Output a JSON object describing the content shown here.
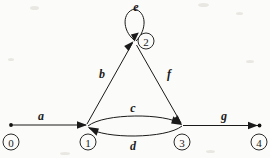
{
  "diagram": {
    "background_color": "#fbfbf9",
    "stroke_color": "#1a1a1a",
    "nodes": [
      {
        "id": "0",
        "label": "0",
        "cx": 11,
        "cy": 142,
        "r": 8,
        "kind": "start"
      },
      {
        "id": "1",
        "label": "1",
        "cx": 88,
        "cy": 142,
        "r": 8,
        "kind": "state"
      },
      {
        "id": "2",
        "label": "2",
        "cx": 146,
        "cy": 41,
        "r": 8,
        "kind": "state"
      },
      {
        "id": "3",
        "label": "3",
        "cx": 182,
        "cy": 142,
        "r": 8,
        "kind": "state"
      },
      {
        "id": "4",
        "label": "4",
        "cx": 259,
        "cy": 142,
        "r": 8,
        "kind": "accept"
      }
    ],
    "edges": [
      {
        "id": "a",
        "label": "a",
        "from": "0",
        "to": "1",
        "shape": "straight",
        "label_x": 41,
        "label_y": 116
      },
      {
        "id": "b",
        "label": "b",
        "from": "1",
        "to": "2",
        "shape": "straight",
        "label_x": 102,
        "label_y": 74
      },
      {
        "id": "c",
        "label": "c",
        "from": "1",
        "to": "3",
        "shape": "arc-upper",
        "label_x": 133,
        "label_y": 108
      },
      {
        "id": "d",
        "label": "d",
        "from": "3",
        "to": "1",
        "shape": "arc-lower",
        "label_x": 133,
        "label_y": 146
      },
      {
        "id": "e",
        "label": "e",
        "from": "2",
        "to": "2",
        "shape": "self-loop",
        "label_x": 136,
        "label_y": 7
      },
      {
        "id": "f",
        "label": "f",
        "from": "2",
        "to": "3",
        "shape": "straight",
        "label_x": 169,
        "label_y": 74
      },
      {
        "id": "g",
        "label": "g",
        "from": "3",
        "to": "4",
        "shape": "straight",
        "label_x": 224,
        "label_y": 116
      }
    ]
  }
}
